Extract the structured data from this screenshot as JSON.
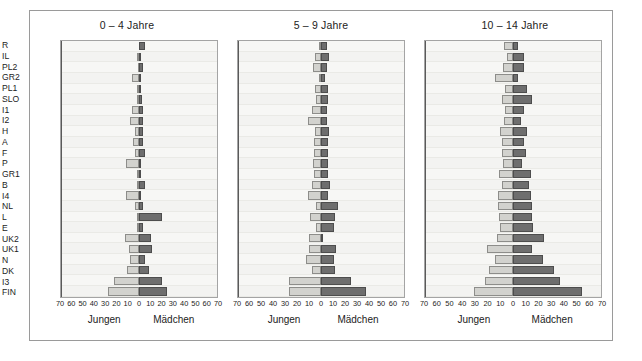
{
  "figure": {
    "axis_caption_boys": "Jungen",
    "axis_caption_girls": "Mädchen",
    "xticks": [
      "70",
      "60",
      "50",
      "40",
      "30",
      "20",
      "10",
      "0",
      "10",
      "20",
      "30",
      "40",
      "50",
      "60",
      "70"
    ],
    "colors": {
      "boys_fill": "#d2d2ce",
      "boys_stroke": "#8d8d8a",
      "girls_fill": "#6e6e6e",
      "girls_stroke": "#4d4d4d",
      "plot_background": "#f6f6f4",
      "frame": "#9a9a9a"
    }
  },
  "chart_data": [
    {
      "type": "bar",
      "title": "0 – 4 Jahre",
      "xlabel": "",
      "ylabel": "",
      "xlim": [
        -70,
        70
      ],
      "grid": false,
      "legend": [
        "Jungen",
        "Mädchen"
      ],
      "orientation": "horizontal-diverging",
      "categories": [
        "R",
        "IL",
        "PL2",
        "GR2",
        "PL1",
        "SLO",
        "I1",
        "I2",
        "H",
        "A",
        "F",
        "P",
        "GR1",
        "B",
        "I4",
        "NL",
        "L",
        "E",
        "UK2",
        "UK1",
        "N",
        "DK",
        "I3",
        "FIN"
      ],
      "series": [
        {
          "name": "Jungen",
          "direction": "left",
          "values": [
            0,
            2,
            1,
            6,
            2,
            2,
            6,
            8,
            4,
            5,
            4,
            12,
            2,
            2,
            12,
            4,
            2,
            2,
            13,
            9,
            8,
            11,
            22,
            28
          ]
        },
        {
          "name": "Mädchen",
          "direction": "right",
          "values": [
            5,
            2,
            4,
            2,
            2,
            3,
            4,
            4,
            4,
            4,
            5,
            2,
            2,
            5,
            2,
            4,
            21,
            4,
            11,
            12,
            5,
            9,
            21,
            25
          ]
        }
      ]
    },
    {
      "type": "bar",
      "title": "5 – 9 Jahre",
      "xlabel": "",
      "ylabel": "",
      "xlim": [
        -70,
        70
      ],
      "grid": false,
      "legend": [
        "Jungen",
        "Mädchen"
      ],
      "orientation": "horizontal-diverging",
      "categories": [
        "R",
        "IL",
        "PL2",
        "GR2",
        "PL1",
        "SLO",
        "I1",
        "I2",
        "H",
        "A",
        "F",
        "P",
        "GR1",
        "B",
        "I4",
        "NL",
        "L",
        "E",
        "UK2",
        "UK1",
        "N",
        "DK",
        "I3",
        "FIN"
      ],
      "series": [
        {
          "name": "Jungen",
          "direction": "left",
          "values": [
            2,
            5,
            7,
            2,
            5,
            4,
            8,
            11,
            5,
            6,
            6,
            7,
            6,
            8,
            11,
            4,
            9,
            4,
            10,
            10,
            13,
            8,
            27,
            27
          ]
        },
        {
          "name": "Mädchen",
          "direction": "right",
          "values": [
            5,
            7,
            5,
            3,
            6,
            6,
            5,
            5,
            7,
            6,
            6,
            6,
            6,
            8,
            6,
            14,
            12,
            11,
            2,
            13,
            11,
            12,
            25,
            38
          ]
        }
      ]
    },
    {
      "type": "bar",
      "title": "10 – 14 Jahre",
      "xlabel": "",
      "ylabel": "",
      "xlim": [
        -70,
        70
      ],
      "grid": false,
      "legend": [
        "Jungen",
        "Mädchen"
      ],
      "orientation": "horizontal-diverging",
      "categories": [
        "R",
        "IL",
        "PL2",
        "GR2",
        "PL1",
        "SLO",
        "I1",
        "I2",
        "H",
        "A",
        "F",
        "P",
        "GR1",
        "B",
        "I4",
        "NL",
        "L",
        "E",
        "UK2",
        "UK1",
        "N",
        "DK",
        "I3",
        "FIN"
      ],
      "series": [
        {
          "name": "Jungen",
          "direction": "left",
          "values": [
            7,
            5,
            8,
            14,
            6,
            9,
            6,
            7,
            10,
            9,
            9,
            8,
            11,
            9,
            12,
            12,
            11,
            10,
            13,
            21,
            14,
            19,
            22,
            31
          ]
        },
        {
          "name": "Mädchen",
          "direction": "right",
          "values": [
            4,
            9,
            9,
            4,
            11,
            15,
            9,
            6,
            11,
            9,
            10,
            7,
            14,
            13,
            14,
            15,
            15,
            16,
            25,
            15,
            24,
            33,
            37,
            55
          ]
        }
      ]
    }
  ]
}
